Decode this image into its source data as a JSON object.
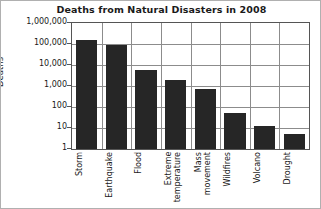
{
  "chart_data": {
    "type": "bar",
    "title": "Deaths from Natural Disasters in 2008",
    "xlabel": "",
    "ylabel": "Deaths",
    "yscale": "log",
    "ylim": [
      1,
      1000000
    ],
    "grid": true,
    "legend": "none",
    "categories": [
      "Storm",
      "Earthquake",
      "Flood",
      "Extreme temperature",
      "Mass movement",
      "Wildfires",
      "Volcano",
      "Drought"
    ],
    "values": [
      150000,
      90000,
      5500,
      2000,
      700,
      50,
      12,
      5
    ],
    "ytick_labels": [
      "1,000,000",
      "100,000",
      "10,000",
      "1,000",
      "100",
      "10",
      "1"
    ],
    "ytick_values": [
      1000000,
      100000,
      10000,
      1000,
      100,
      10,
      1
    ],
    "bar_color": "#262626",
    "grid_color": "#8c8c8c",
    "axis_color": "#555555",
    "background": "#ffffff"
  },
  "xtick_display": [
    "Storm",
    "Earthquake",
    "Flood",
    "Extreme\ntemperature",
    "Mass\nmovement",
    "Wildfires",
    "Volcano",
    "Drought"
  ]
}
